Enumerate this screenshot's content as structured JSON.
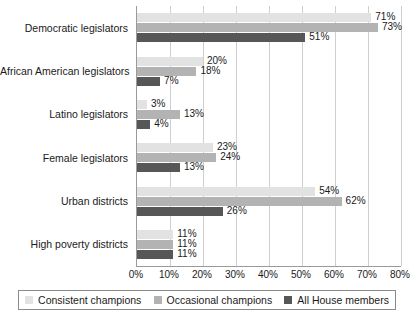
{
  "chart_data": {
    "type": "bar",
    "orientation": "horizontal",
    "title": "",
    "xlabel": "",
    "ylabel": "",
    "xlim": [
      0,
      80
    ],
    "xtick_labels": [
      "0%",
      "10%",
      "20%",
      "30%",
      "40%",
      "50%",
      "60%",
      "70%",
      "80%"
    ],
    "xtick_values": [
      0,
      10,
      20,
      30,
      40,
      50,
      60,
      70,
      80
    ],
    "grid": "vertical",
    "legend_position": "bottom",
    "value_suffix": "%",
    "categories": [
      "Democratic legislators",
      "African American legislators",
      "Latino legislators",
      "Female legislators",
      "Urban districts",
      "High poverty districts"
    ],
    "series": [
      {
        "name": "Consistent champions",
        "color": "#e2e2e2",
        "values": [
          71,
          20,
          3,
          23,
          54,
          11
        ],
        "labels": [
          "71%",
          "20%",
          "3%",
          "23%",
          "54%",
          "11%"
        ]
      },
      {
        "name": "Occasional champions",
        "color": "#b3b3b3",
        "values": [
          73,
          18,
          13,
          24,
          62,
          11
        ],
        "labels": [
          "73%",
          "18%",
          "13%",
          "24%",
          "62%",
          "11%"
        ]
      },
      {
        "name": "All House members",
        "color": "#575757",
        "values": [
          51,
          7,
          4,
          13,
          26,
          11
        ],
        "labels": [
          "51%",
          "7%",
          "4%",
          "13%",
          "26%",
          "11%"
        ]
      }
    ]
  }
}
